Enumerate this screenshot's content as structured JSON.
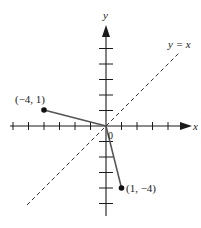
{
  "diagram": {
    "type": "coordinate-plane-reflection",
    "axes": {
      "x_label": "x",
      "y_label": "y",
      "origin_label": "0",
      "x_ticks": [
        -6,
        -5,
        -4,
        -3,
        -2,
        -1,
        1,
        2,
        3,
        4,
        5
      ],
      "y_ticks": [
        -5,
        -4,
        -3,
        -2,
        -1,
        1,
        2,
        3,
        4,
        5
      ]
    },
    "line": {
      "label": "y = x",
      "style": "dashed"
    },
    "points": [
      {
        "label": "(−4, 1)",
        "x": -4,
        "y": 1
      },
      {
        "label": "(1, −4)",
        "x": 1,
        "y": -4
      }
    ],
    "segments": [
      {
        "from": "origin",
        "to": "(−4, 1)"
      },
      {
        "from": "origin",
        "to": "(1, −4)"
      }
    ],
    "colors": {
      "axis": "#1a1a1a",
      "segment": "#555555",
      "dashed_line": "#333333",
      "point": "#111111"
    }
  }
}
